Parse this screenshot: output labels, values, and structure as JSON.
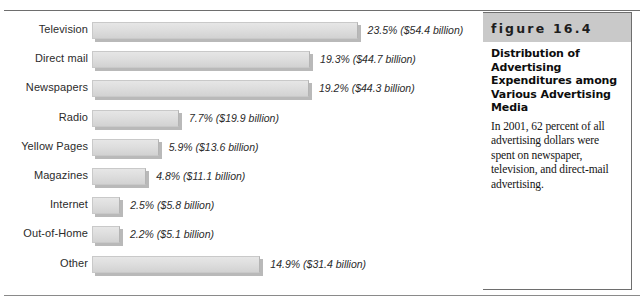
{
  "chart_data": {
    "type": "bar",
    "orientation": "horizontal",
    "title": "Distribution of Advertising Expenditures among Various Advertising Media",
    "xlabel": "",
    "ylabel": "",
    "grid": false,
    "legend": "none",
    "xlim": [
      0,
      25
    ],
    "categories": [
      "Television",
      "Direct mail",
      "Newspapers",
      "Radio",
      "Yellow Pages",
      "Magazines",
      "Internet",
      "Out-of-Home",
      "Other"
    ],
    "values": [
      23.5,
      19.3,
      19.2,
      7.7,
      5.9,
      4.8,
      2.5,
      2.2,
      14.9
    ],
    "value_unit": "percent",
    "dollars_billions": [
      54.4,
      44.7,
      44.3,
      19.9,
      13.6,
      11.1,
      5.8,
      5.1,
      31.4
    ],
    "data_labels": [
      "23.5% ($54.4 billion)",
      "19.3% ($44.7 billion)",
      "19.2% ($44.3 billion)",
      "7.7% ($19.9 billion)",
      "5.9% ($13.6 billion)",
      "4.8% ($11.1 billion)",
      "2.5% ($5.8 billion)",
      "2.2% ($5.1 billion)",
      "14.9% ($31.4 billion)"
    ]
  },
  "caption": {
    "figure_number": "figure 16.4",
    "title": "Distribution of Advertising Expenditures among Various Advertising Media",
    "body": "In 2001, 62 percent of all advertising dollars were spent on newspaper, television, and direct-mail advertising."
  },
  "colors": {
    "bar_fill": "#dedede",
    "bar_border": "#c9c9c9",
    "bar_shadow": "#b9b9b9",
    "banner": "#c9c9c9",
    "rule": "#6e6e6e",
    "text": "#1d1d1d"
  }
}
